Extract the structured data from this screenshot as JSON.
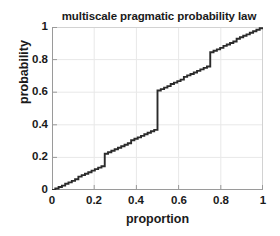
{
  "chart_data": {
    "type": "line",
    "title": "multiscale pragmatic probability law",
    "xlabel": "proportion",
    "ylabel": "probability",
    "xlim": [
      0,
      1
    ],
    "ylim": [
      0,
      1
    ],
    "grid": true,
    "legend": null,
    "xticks": [
      0,
      0.2,
      0.4,
      0.6,
      0.8,
      1
    ],
    "xticklabels": [
      "0",
      "0.2",
      "0.4",
      "0.6",
      "0.8",
      "1"
    ],
    "yticks": [
      0,
      0.2,
      0.4,
      0.6,
      0.8,
      1
    ],
    "yticklabels": [
      "0",
      "0.2",
      "0.4",
      "0.6",
      "0.8",
      "1"
    ],
    "series": [
      {
        "name": "cumulative probability",
        "style": "staircase",
        "color": "#2b2b2b",
        "x": [
          0,
          0.0156,
          0.0156,
          0.0313,
          0.0313,
          0.0469,
          0.0469,
          0.0625,
          0.0625,
          0.0781,
          0.0781,
          0.0938,
          0.0938,
          0.1094,
          0.1094,
          0.125,
          0.125,
          0.1406,
          0.1406,
          0.1563,
          0.1563,
          0.1719,
          0.1719,
          0.1875,
          0.1875,
          0.2031,
          0.2031,
          0.2188,
          0.2188,
          0.2344,
          0.2344,
          0.25,
          0.25,
          0.2656,
          0.2656,
          0.2813,
          0.2813,
          0.2969,
          0.2969,
          0.3125,
          0.3125,
          0.3281,
          0.3281,
          0.3438,
          0.3438,
          0.3594,
          0.3594,
          0.375,
          0.375,
          0.3906,
          0.3906,
          0.4063,
          0.4063,
          0.4219,
          0.4219,
          0.4375,
          0.4375,
          0.4531,
          0.4531,
          0.4688,
          0.4688,
          0.4844,
          0.4844,
          0.5,
          0.5,
          0.5156,
          0.5156,
          0.5313,
          0.5313,
          0.5469,
          0.5469,
          0.5625,
          0.5625,
          0.5781,
          0.5781,
          0.5938,
          0.5938,
          0.6094,
          0.6094,
          0.625,
          0.625,
          0.6406,
          0.6406,
          0.6563,
          0.6563,
          0.6719,
          0.6719,
          0.6875,
          0.6875,
          0.7031,
          0.7031,
          0.7188,
          0.7188,
          0.7344,
          0.7344,
          0.75,
          0.75,
          0.7656,
          0.7656,
          0.7813,
          0.7813,
          0.7969,
          0.7969,
          0.8125,
          0.8125,
          0.8281,
          0.8281,
          0.8438,
          0.8438,
          0.8594,
          0.8594,
          0.875,
          0.875,
          0.8906,
          0.8906,
          0.9063,
          0.9063,
          0.9219,
          0.9219,
          0.9375,
          0.9375,
          0.9531,
          0.9531,
          0.9688,
          0.9688,
          0.9844,
          0.9844,
          1
        ],
        "y": [
          0,
          0,
          0.009,
          0.009,
          0.018,
          0.018,
          0.027,
          0.027,
          0.038,
          0.038,
          0.047,
          0.047,
          0.056,
          0.056,
          0.066,
          0.066,
          0.082,
          0.082,
          0.091,
          0.091,
          0.1,
          0.1,
          0.109,
          0.109,
          0.119,
          0.119,
          0.128,
          0.128,
          0.137,
          0.137,
          0.146,
          0.146,
          0.222,
          0.222,
          0.232,
          0.232,
          0.241,
          0.241,
          0.25,
          0.25,
          0.259,
          0.259,
          0.268,
          0.268,
          0.278,
          0.278,
          0.287,
          0.287,
          0.305,
          0.305,
          0.314,
          0.314,
          0.323,
          0.323,
          0.332,
          0.332,
          0.342,
          0.342,
          0.351,
          0.351,
          0.36,
          0.36,
          0.369,
          0.369,
          0.61,
          0.61,
          0.619,
          0.619,
          0.628,
          0.628,
          0.637,
          0.637,
          0.65,
          0.65,
          0.659,
          0.659,
          0.668,
          0.668,
          0.677,
          0.677,
          0.694,
          0.694,
          0.703,
          0.703,
          0.712,
          0.712,
          0.721,
          0.721,
          0.731,
          0.731,
          0.74,
          0.74,
          0.749,
          0.749,
          0.758,
          0.758,
          0.845,
          0.845,
          0.854,
          0.854,
          0.863,
          0.863,
          0.872,
          0.872,
          0.884,
          0.884,
          0.893,
          0.893,
          0.902,
          0.902,
          0.911,
          0.911,
          0.928,
          0.928,
          0.937,
          0.937,
          0.946,
          0.946,
          0.955,
          0.955,
          0.965,
          0.965,
          0.974,
          0.974,
          0.983,
          0.983,
          0.992,
          0.992
        ],
        "notable_jumps": [
          {
            "x": 0.125,
            "from": 0.066,
            "to": 0.082
          },
          {
            "x": 0.25,
            "from": 0.146,
            "to": 0.222
          },
          {
            "x": 0.375,
            "from": 0.287,
            "to": 0.305
          },
          {
            "x": 0.5,
            "from": 0.369,
            "to": 0.61
          },
          {
            "x": 0.625,
            "from": 0.677,
            "to": 0.694
          },
          {
            "x": 0.75,
            "from": 0.758,
            "to": 0.845
          },
          {
            "x": 0.875,
            "from": 0.911,
            "to": 0.928
          }
        ]
      }
    ],
    "colors": {
      "line": "#2b2b2b",
      "grid": "#e8e8e8",
      "axis": "#9a9a9a",
      "text": "#1a1a1a",
      "background": "#ffffff"
    }
  }
}
